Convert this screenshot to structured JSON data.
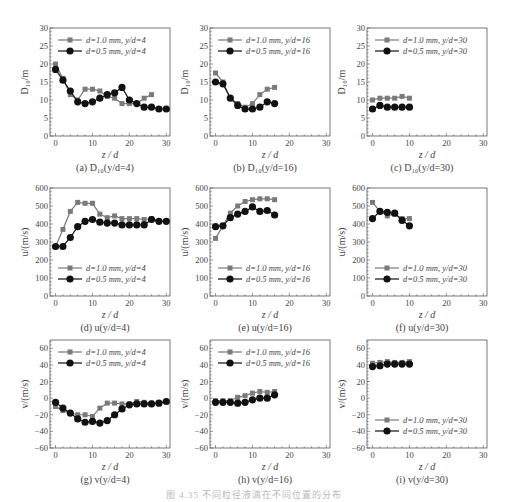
{
  "figure": {
    "caption": "图 4.35 不同粒径液滴在不同位置的分布",
    "x_label": "z/d",
    "colors": {
      "d1": "#7a7a7a",
      "d05": "#111111",
      "axis": "#555555",
      "text": "#444444"
    }
  },
  "chart_data": [
    {
      "id": "a",
      "type": "line",
      "title": "(a) D10(y/d=4)",
      "panel_label": "(a) D₁₀(y/d=4)",
      "xlabel": "z/d",
      "ylabel": "D10/m",
      "ylabel_display": "D₁₀/m",
      "xlim": [
        -1.5,
        31
      ],
      "ylim": [
        0,
        30
      ],
      "xticks": [
        0,
        10,
        20,
        30
      ],
      "yticks": [
        0,
        5,
        10,
        15,
        20,
        25,
        30
      ],
      "legend_position": "top",
      "grid": false,
      "series": [
        {
          "name": "d=1.0 mm, y/d=4",
          "marker": "square",
          "x": [
            0,
            2,
            4,
            6,
            8,
            10,
            12,
            14,
            16,
            18,
            20,
            22,
            24,
            26
          ],
          "y": [
            20,
            16,
            11.5,
            10,
            13,
            13,
            12.5,
            11,
            10.5,
            9,
            9,
            9,
            10.5,
            11.5
          ]
        },
        {
          "name": "d=0.5 mm, y/d=4",
          "marker": "circle",
          "x": [
            0,
            2,
            4,
            6,
            8,
            10,
            12,
            14,
            16,
            18,
            20,
            22,
            24,
            26,
            28,
            30
          ],
          "y": [
            18.5,
            15.5,
            12.5,
            9.5,
            9,
            9.5,
            10.5,
            11.5,
            12,
            13.5,
            10,
            9,
            8,
            8,
            7.5,
            7.5
          ]
        }
      ]
    },
    {
      "id": "b",
      "type": "line",
      "title": "(b) D10(y/d=16)",
      "panel_label": "(b) D₁₀(y/d=16)",
      "xlabel": "z/d",
      "ylabel": "D10/m",
      "ylabel_display": "D₁₀/m",
      "xlim": [
        -1.5,
        31
      ],
      "ylim": [
        0,
        30
      ],
      "xticks": [
        0,
        10,
        20,
        30
      ],
      "yticks": [
        0,
        5,
        10,
        15,
        20,
        25,
        30
      ],
      "legend_position": "top",
      "grid": false,
      "series": [
        {
          "name": "d=1.0 mm, y/d=16",
          "marker": "square",
          "x": [
            0,
            2,
            4,
            6,
            8,
            10,
            12,
            14,
            16
          ],
          "y": [
            17.5,
            15,
            10.5,
            9,
            8,
            9,
            11.5,
            13,
            13.5
          ]
        },
        {
          "name": "d=0.5 mm, y/d=16",
          "marker": "circle",
          "x": [
            0,
            2,
            4,
            6,
            8,
            10,
            12,
            14,
            16
          ],
          "y": [
            15,
            14.5,
            10.5,
            8.5,
            7.5,
            7.5,
            8,
            9.5,
            9
          ]
        }
      ]
    },
    {
      "id": "c",
      "type": "line",
      "title": "(c) D10(y/d=30)",
      "panel_label": "(c) D₁₀(y/d=30)",
      "xlabel": "z/d",
      "ylabel": "D10/m",
      "ylabel_display": "D₁₀/m",
      "xlim": [
        -1.5,
        31
      ],
      "ylim": [
        0,
        30
      ],
      "xticks": [
        0,
        10,
        20,
        30
      ],
      "yticks": [
        0,
        5,
        10,
        15,
        20,
        25,
        30
      ],
      "legend_position": "top",
      "grid": false,
      "series": [
        {
          "name": "d=1.0 mm, y/d=30",
          "marker": "square",
          "x": [
            0,
            2,
            4,
            6,
            8,
            10
          ],
          "y": [
            10,
            10.5,
            10.5,
            10.5,
            11,
            10.5
          ]
        },
        {
          "name": "d=0.5 mm, y/d=30",
          "marker": "circle",
          "x": [
            0,
            2,
            4,
            6,
            8,
            10
          ],
          "y": [
            7.5,
            8.5,
            8,
            8,
            8,
            8
          ]
        }
      ]
    },
    {
      "id": "d",
      "type": "line",
      "title": "(d) u(y/d=4)",
      "panel_label": "(d) u(y/d=4)",
      "xlabel": "z/d",
      "ylabel": "u/(m/s)",
      "ylabel_display": "u/(m/s)",
      "xlim": [
        -1.5,
        31
      ],
      "ylim": [
        0,
        600
      ],
      "xticks": [
        0,
        10,
        20,
        30
      ],
      "yticks": [
        0,
        100,
        200,
        300,
        400,
        500,
        600
      ],
      "legend_position": "bottom",
      "grid": false,
      "series": [
        {
          "name": "d=1.0 mm, y/d=4",
          "marker": "square",
          "x": [
            0,
            2,
            4,
            6,
            8,
            10,
            12,
            14,
            16,
            18,
            20,
            22,
            24,
            26,
            28,
            30
          ],
          "y": [
            275,
            370,
            470,
            520,
            515,
            515,
            455,
            435,
            445,
            430,
            430,
            430,
            425,
            430,
            415,
            415
          ]
        },
        {
          "name": "d=0.5 mm, y/d=4",
          "marker": "circle",
          "x": [
            0,
            2,
            4,
            6,
            8,
            10,
            12,
            14,
            16,
            18,
            20,
            22,
            24,
            26,
            28,
            30
          ],
          "y": [
            275,
            275,
            325,
            385,
            415,
            425,
            410,
            405,
            405,
            395,
            395,
            395,
            395,
            425,
            415,
            415
          ]
        }
      ]
    },
    {
      "id": "e",
      "type": "line",
      "title": "(e) u(y/d=16)",
      "panel_label": "(e) u(y/d=16)",
      "xlabel": "z/d",
      "ylabel": "u/(m/s)",
      "ylabel_display": "u/(m/s)",
      "xlim": [
        -1.5,
        31
      ],
      "ylim": [
        0,
        600
      ],
      "xticks": [
        0,
        10,
        20,
        30
      ],
      "yticks": [
        0,
        100,
        200,
        300,
        400,
        500,
        600
      ],
      "legend_position": "bottom",
      "grid": false,
      "series": [
        {
          "name": "d=1.0 mm, y/d=16",
          "marker": "square",
          "x": [
            0,
            2,
            4,
            6,
            8,
            10,
            12,
            14,
            16
          ],
          "y": [
            320,
            390,
            460,
            500,
            525,
            535,
            540,
            540,
            535
          ]
        },
        {
          "name": "d=0.5 mm, y/d=16",
          "marker": "circle",
          "x": [
            0,
            2,
            4,
            6,
            8,
            10,
            12,
            14,
            16
          ],
          "y": [
            385,
            390,
            435,
            455,
            470,
            495,
            470,
            475,
            450
          ]
        }
      ]
    },
    {
      "id": "f",
      "type": "line",
      "title": "(f) u(y/d=30)",
      "panel_label": "(f) u(y/d=30)",
      "xlabel": "z/d",
      "ylabel": "u/(m/s)",
      "ylabel_display": "u/(m/s)",
      "xlim": [
        -1.5,
        31
      ],
      "ylim": [
        0,
        600
      ],
      "xticks": [
        0,
        10,
        20,
        30
      ],
      "yticks": [
        0,
        100,
        200,
        300,
        400,
        500,
        600
      ],
      "legend_position": "bottom",
      "grid": false,
      "series": [
        {
          "name": "d=1.0 mm, y/d=30",
          "marker": "square",
          "x": [
            0,
            2,
            4,
            6,
            8,
            10
          ],
          "y": [
            520,
            470,
            445,
            455,
            430,
            430
          ]
        },
        {
          "name": "d=0.5 mm, y/d=30",
          "marker": "circle",
          "x": [
            0,
            2,
            4,
            6,
            8,
            10
          ],
          "y": [
            430,
            470,
            465,
            460,
            420,
            390
          ]
        }
      ]
    },
    {
      "id": "g",
      "type": "line",
      "title": "(g) v(y/d=4)",
      "panel_label": "(g) v(y/d=4)",
      "xlabel": "z/d",
      "ylabel": "v/(m/s)",
      "ylabel_display": "v/(m/s)",
      "xlim": [
        -1.5,
        31
      ],
      "ylim": [
        -60,
        70
      ],
      "xticks": [
        0,
        10,
        20,
        30
      ],
      "yticks": [
        -60,
        -40,
        -20,
        0,
        20,
        40,
        60
      ],
      "legend_position": "top",
      "grid": false,
      "series": [
        {
          "name": "d=1.0 mm, y/d=4",
          "marker": "square",
          "x": [
            0,
            2,
            4,
            6,
            8,
            10,
            12,
            14,
            16,
            18,
            20,
            22,
            24,
            26,
            28,
            30
          ],
          "y": [
            -10,
            -15,
            -18,
            -20,
            -20,
            -22,
            -12,
            -6,
            -6,
            -7,
            -7,
            -4,
            -5,
            -6,
            -6,
            -4
          ]
        },
        {
          "name": "d=0.5 mm, y/d=4",
          "marker": "circle",
          "x": [
            0,
            2,
            4,
            6,
            8,
            10,
            12,
            14,
            16,
            18,
            20,
            22,
            24,
            26,
            28,
            30
          ],
          "y": [
            -5,
            -12,
            -18,
            -25,
            -29,
            -28,
            -30,
            -27,
            -20,
            -13,
            -8,
            -7,
            -7,
            -7,
            -6,
            -4
          ]
        }
      ]
    },
    {
      "id": "h",
      "type": "line",
      "title": "(h) v(y/d=16)",
      "panel_label": "(h) v(y/d=16)",
      "xlabel": "z/d",
      "ylabel": "v/(m/s)",
      "ylabel_display": "v/(m/s)",
      "xlim": [
        -1.5,
        31
      ],
      "ylim": [
        -60,
        70
      ],
      "xticks": [
        0,
        10,
        20,
        30
      ],
      "yticks": [
        -60,
        -40,
        -20,
        0,
        20,
        40,
        60
      ],
      "legend_position": "top",
      "grid": false,
      "series": [
        {
          "name": "d=1.0 mm, y/d=16",
          "marker": "square",
          "x": [
            0,
            2,
            4,
            6,
            8,
            10,
            12,
            14,
            16
          ],
          "y": [
            -3,
            -3,
            -3,
            1,
            3,
            6,
            8,
            7,
            8
          ]
        },
        {
          "name": "d=0.5 mm, y/d=16",
          "marker": "circle",
          "x": [
            0,
            2,
            4,
            6,
            8,
            10,
            12,
            14,
            16
          ],
          "y": [
            -5,
            -5,
            -5,
            -6,
            -5,
            -2,
            0,
            0,
            4
          ]
        }
      ]
    },
    {
      "id": "i",
      "type": "line",
      "title": "(i) v(y/d=30)",
      "panel_label": "(i) v(y/d=30)",
      "xlabel": "z/d",
      "ylabel": "v/(m/s)",
      "ylabel_display": "v/(m/s)",
      "xlim": [
        -1.5,
        31
      ],
      "ylim": [
        -60,
        70
      ],
      "xticks": [
        0,
        10,
        20,
        30
      ],
      "yticks": [
        -60,
        -40,
        -20,
        0,
        20,
        40,
        60
      ],
      "legend_position": "bottom",
      "grid": false,
      "series": [
        {
          "name": "d=1.0 mm, y/d=30",
          "marker": "square",
          "x": [
            0,
            2,
            4,
            6,
            8,
            10
          ],
          "y": [
            42,
            43,
            44,
            43,
            43,
            44
          ]
        },
        {
          "name": "d=0.5 mm, y/d=30",
          "marker": "circle",
          "x": [
            0,
            2,
            4,
            6,
            8,
            10
          ],
          "y": [
            38,
            39,
            41,
            41,
            41,
            41
          ]
        }
      ]
    }
  ],
  "layout": {
    "cols_x": [
      50,
      210,
      367
    ],
    "rows_y": [
      28,
      188,
      340
    ],
    "plot_w": 120,
    "plot_h": 108
  }
}
